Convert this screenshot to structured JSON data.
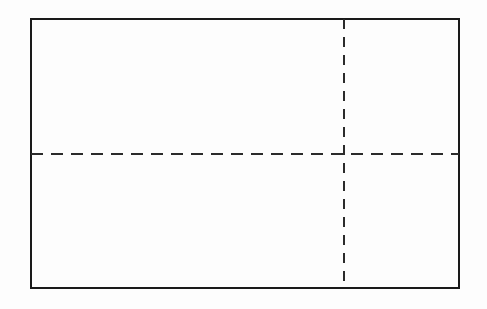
{
  "figure": {
    "title": "",
    "background_color": "#fdfdfd",
    "canvas": {
      "width": 487,
      "height": 309
    },
    "shapes": {
      "rectangle": {
        "name": "outer rectangle",
        "label": "",
        "x": 30,
        "y": 18,
        "width": 430,
        "height": 271,
        "stroke_color": "#1a1a1a",
        "stroke_width": 2,
        "fill": "none",
        "line_style": "solid"
      },
      "horizontal_centerline": {
        "name": "horizontal dashed centerline",
        "label": "",
        "x1": 31,
        "y1": 154,
        "x2": 459,
        "y2": 154,
        "stroke_color": "#2b2b2b",
        "stroke_width": 2,
        "line_style": "dashed",
        "dash_length": 12,
        "gap_length": 8
      },
      "vertical_centerline": {
        "name": "vertical dashed centerline",
        "label": "",
        "x1": 344,
        "y1": 19,
        "x2": 344,
        "y2": 288,
        "stroke_color": "#2b2b2b",
        "stroke_width": 2,
        "line_style": "dashed",
        "dash_length": 10,
        "gap_length": 8
      }
    },
    "annotations": [],
    "labels": []
  }
}
